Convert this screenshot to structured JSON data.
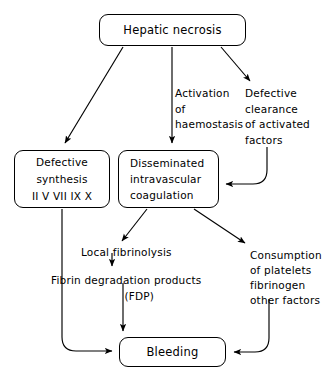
{
  "diagram": {
    "type": "flowchart",
    "colors": {
      "stroke": "#000000",
      "background": "#ffffff",
      "text": "#000000"
    },
    "nodes": [
      {
        "id": "hepatic-necrosis",
        "shape": "rounded-rectangle",
        "lines": [
          "Hepatic necrosis"
        ]
      },
      {
        "id": "defective-synthesis",
        "shape": "rounded-rectangle",
        "lines": [
          "Defective",
          "synthesis",
          "II  V  VII  IX  X"
        ]
      },
      {
        "id": "disseminated-intravascular-coagulation",
        "shape": "rounded-rectangle",
        "lines": [
          "Disseminated",
          "intravascular",
          "coagulation"
        ]
      },
      {
        "id": "bleeding",
        "shape": "rounded-rectangle",
        "lines": [
          "Bleeding"
        ]
      }
    ],
    "labels": [
      {
        "id": "activation-of-haemostasis",
        "lines": [
          "Activation",
          "of",
          "haemostasis"
        ]
      },
      {
        "id": "defective-clearance",
        "lines": [
          "Defective",
          "clearance",
          "of activated",
          "factors"
        ]
      },
      {
        "id": "local-fibrinolysis",
        "lines": [
          "Local fibrinolysis"
        ]
      },
      {
        "id": "fibrin-degradation-products",
        "lines": [
          "Fibrin degradation products",
          "(FDP)"
        ]
      },
      {
        "id": "consumption",
        "lines": [
          "Consumption",
          "of platelets",
          "fibrinogen",
          "other factors"
        ]
      }
    ],
    "edges": [
      {
        "from": "hepatic-necrosis",
        "to": "defective-synthesis",
        "style": "diagonal-arrow"
      },
      {
        "from": "hepatic-necrosis",
        "to": "disseminated-intravascular-coagulation",
        "style": "vertical-arrow",
        "label": "activation-of-haemostasis"
      },
      {
        "from": "hepatic-necrosis",
        "to": "defective-clearance",
        "style": "diagonal-arrow"
      },
      {
        "from": "defective-clearance",
        "to": "disseminated-intravascular-coagulation",
        "style": "elbow-curve-arrow"
      },
      {
        "from": "disseminated-intravascular-coagulation",
        "to": "local-fibrinolysis",
        "style": "diagonal-arrow"
      },
      {
        "from": "disseminated-intravascular-coagulation",
        "to": "consumption",
        "style": "diagonal-arrow"
      },
      {
        "from": "local-fibrinolysis",
        "to": "fibrin-degradation-products",
        "style": "vertical-arrow"
      },
      {
        "from": "fibrin-degradation-products",
        "to": "bleeding",
        "style": "vertical-arrow"
      },
      {
        "from": "defective-synthesis",
        "to": "bleeding",
        "style": "elbow-curve-arrow"
      },
      {
        "from": "consumption",
        "to": "bleeding",
        "style": "elbow-curve-arrow"
      }
    ]
  },
  "nodes": {
    "hepatic_necrosis": {
      "label": "Hepatic necrosis"
    },
    "defective_synthesis": {
      "line1": "Defective",
      "line2": "synthesis",
      "line3": "II  V  VII  IX  X"
    },
    "dic": {
      "line1": "Disseminated",
      "line2": "intravascular",
      "line3": "coagulation"
    },
    "bleeding": {
      "label": "Bleeding"
    }
  },
  "labels": {
    "activation": {
      "line1": "Activation",
      "line2": "of",
      "line3": "haemostasis"
    },
    "defective_clearance": {
      "line1": "Defective",
      "line2": "clearance",
      "line3": "of activated",
      "line4": "factors"
    },
    "local_fibrinolysis": {
      "text": "Local fibrinolysis"
    },
    "fdp": {
      "line1": "Fibrin degradation products",
      "line2": "(FDP)"
    },
    "consumption": {
      "line1": "Consumption",
      "line2": "of platelets",
      "line3": "fibrinogen",
      "line4": "other factors"
    }
  }
}
